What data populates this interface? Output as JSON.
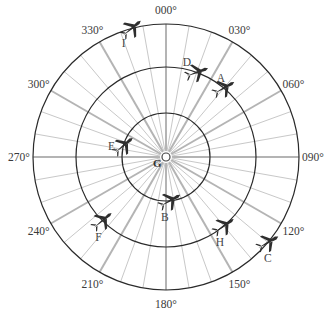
{
  "diagram": {
    "type": "radar-compass",
    "center_label": "G",
    "rings": 3,
    "spoke_interval_deg": 10,
    "colors": {
      "ring": "#2a2a2a",
      "spoke": "#c8c8c8",
      "spoke_major": "#b4b4b4",
      "plane": "#2e2e2e",
      "text": "#3a3a3a"
    },
    "bearings": [
      {
        "deg": 0,
        "label": "000°"
      },
      {
        "deg": 30,
        "label": "030°"
      },
      {
        "deg": 60,
        "label": "060°"
      },
      {
        "deg": 90,
        "label": "090°"
      },
      {
        "deg": 120,
        "label": "120°"
      },
      {
        "deg": 150,
        "label": "150°"
      },
      {
        "deg": 180,
        "label": "180°"
      },
      {
        "deg": 210,
        "label": "210°"
      },
      {
        "deg": 240,
        "label": "240°"
      },
      {
        "deg": 270,
        "label": "270°"
      },
      {
        "deg": 300,
        "label": "300°"
      },
      {
        "deg": 330,
        "label": "330°"
      }
    ],
    "aircraft": [
      {
        "id": "A",
        "bearing": 40,
        "ring": 2,
        "heading": 60
      },
      {
        "id": "B",
        "bearing": 175,
        "ring": 1,
        "heading": 60
      },
      {
        "id": "C",
        "bearing": 130,
        "ring": 3,
        "heading": 60
      },
      {
        "id": "D",
        "bearing": 20,
        "ring": 2,
        "heading": 70
      },
      {
        "id": "E",
        "bearing": 285,
        "ring": 1,
        "heading": 50
      },
      {
        "id": "F",
        "bearing": 225,
        "ring": 2,
        "heading": 50
      },
      {
        "id": "H",
        "bearing": 140,
        "ring": 2,
        "heading": 55
      },
      {
        "id": "I",
        "bearing": 345,
        "ring": 3,
        "heading": 50
      }
    ]
  }
}
